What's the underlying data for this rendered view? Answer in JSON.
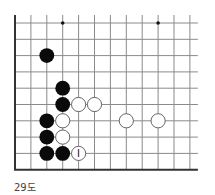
{
  "diagram": {
    "caption": "29도",
    "grid": {
      "origin_x": 15,
      "origin_y": 23,
      "spacing_x": 15.9,
      "spacing_y": 16.3,
      "cols": 12,
      "rows": 10,
      "line_color": "#8a8a8a",
      "edge_color": "#333333"
    },
    "star_points": [
      {
        "col": 3,
        "row": 0
      },
      {
        "col": 9,
        "row": 0
      }
    ],
    "stones": [
      {
        "color": "black",
        "col": 2,
        "row": 2
      },
      {
        "color": "black",
        "col": 3,
        "row": 4
      },
      {
        "color": "black",
        "col": 3,
        "row": 5
      },
      {
        "color": "white",
        "col": 4,
        "row": 5
      },
      {
        "color": "white",
        "col": 5,
        "row": 5
      },
      {
        "color": "black",
        "col": 2,
        "row": 6
      },
      {
        "color": "white",
        "col": 3,
        "row": 6
      },
      {
        "color": "white",
        "col": 7,
        "row": 6
      },
      {
        "color": "white",
        "col": 9,
        "row": 6
      },
      {
        "color": "black",
        "col": 2,
        "row": 7
      },
      {
        "color": "white",
        "col": 3,
        "row": 7
      },
      {
        "color": "black",
        "col": 2,
        "row": 8
      },
      {
        "color": "black",
        "col": 3,
        "row": 8
      },
      {
        "color": "white",
        "col": 4,
        "row": 8,
        "label": "I"
      }
    ]
  }
}
